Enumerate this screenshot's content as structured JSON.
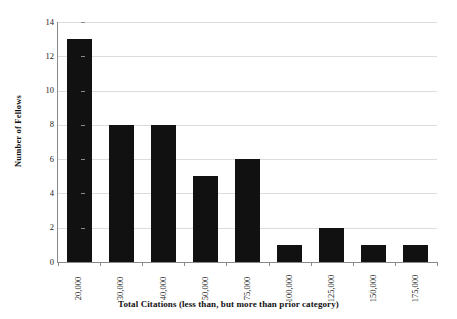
{
  "chart_data": {
    "type": "bar",
    "title": "",
    "subtitle": "",
    "xlabel": "Total Citations (less than, but more than prior category)",
    "ylabel": "Number of Fellows",
    "categories": [
      "20,000",
      "30,000",
      "40,000",
      "50,000",
      "75,000",
      "100,000",
      "125,000",
      "150,000",
      "175,000"
    ],
    "values": [
      13,
      8,
      8,
      5,
      6,
      1,
      2,
      1,
      1
    ],
    "ylim": [
      0,
      14
    ],
    "yticks": [
      0,
      2,
      4,
      6,
      8,
      10,
      12,
      14
    ],
    "ytick_labels": [
      "0",
      "2",
      "4",
      "6",
      "8",
      "10",
      "12",
      "14"
    ],
    "grid": "horizontal",
    "legend": "none",
    "bar_color": "#111111",
    "gridline_color": "#dcdcdc",
    "axis_color": "#8a8a8a",
    "background_color": "#ffffff"
  }
}
